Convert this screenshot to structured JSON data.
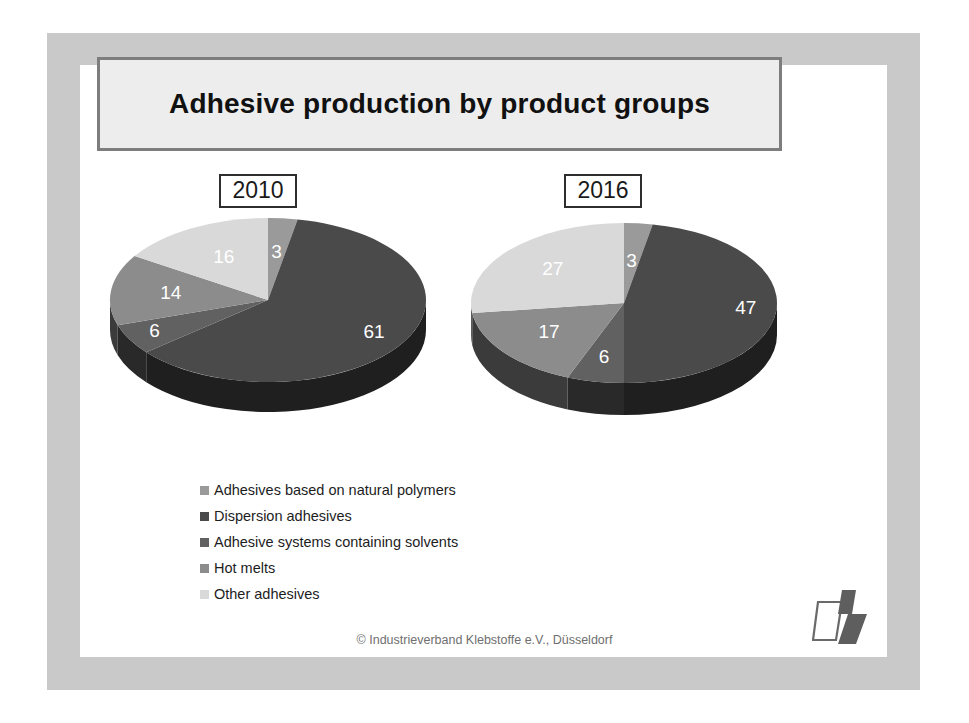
{
  "slide": {
    "title": "Adhesive production by product groups",
    "footer_copyright": "© Industrieverband Klebstoffe e.V., Düsseldorf",
    "logo_name": "industrieverband-klebstoffe-logo"
  },
  "colors": {
    "frame_band": "#c9c9c9",
    "page_background": "#ffffff",
    "title_fill": "#ededed",
    "title_border": "#7d7d7d",
    "text_dark": "#111111",
    "footer_text": "#6f6f6f",
    "slice_natural_polymers": "#9a9a9a",
    "slice_dispersion": "#4a4a4a",
    "slice_solvents": "#616161",
    "slice_hot_melts": "#8c8c8c",
    "slice_other": "#d9d9d9",
    "pie_side_dark": "#1f1f1f",
    "label_text": "#ffffff"
  },
  "legend": {
    "items": [
      {
        "label": "Adhesives based on natural polymers",
        "color": "#9a9a9a"
      },
      {
        "label": "Dispersion adhesives",
        "color": "#4a4a4a"
      },
      {
        "label": "Adhesive systems containing solvents",
        "color": "#616161"
      },
      {
        "label": "Hot melts",
        "color": "#8c8c8c"
      },
      {
        "label": "Other adhesives",
        "color": "#d9d9d9"
      }
    ]
  },
  "chart_data": {
    "type": "pie",
    "title": "Adhesive production by product groups",
    "unit": "percent",
    "legend_position": "bottom-left",
    "categories": [
      "Adhesives based on natural polymers",
      "Dispersion adhesives",
      "Adhesive systems containing solvents",
      "Hot melts",
      "Other adhesives"
    ],
    "colors": [
      "#9a9a9a",
      "#4a4a4a",
      "#616161",
      "#8c8c8c",
      "#d9d9d9"
    ],
    "charts": [
      {
        "name": "2010",
        "label": "2010",
        "values": [
          3,
          61,
          6,
          14,
          16
        ],
        "labels": [
          "3",
          "61",
          "6",
          "14",
          "16"
        ]
      },
      {
        "name": "2016",
        "label": "2016",
        "values": [
          3,
          47,
          6,
          17,
          27
        ],
        "labels": [
          "3",
          "47",
          "6",
          "17",
          "27"
        ]
      }
    ]
  }
}
